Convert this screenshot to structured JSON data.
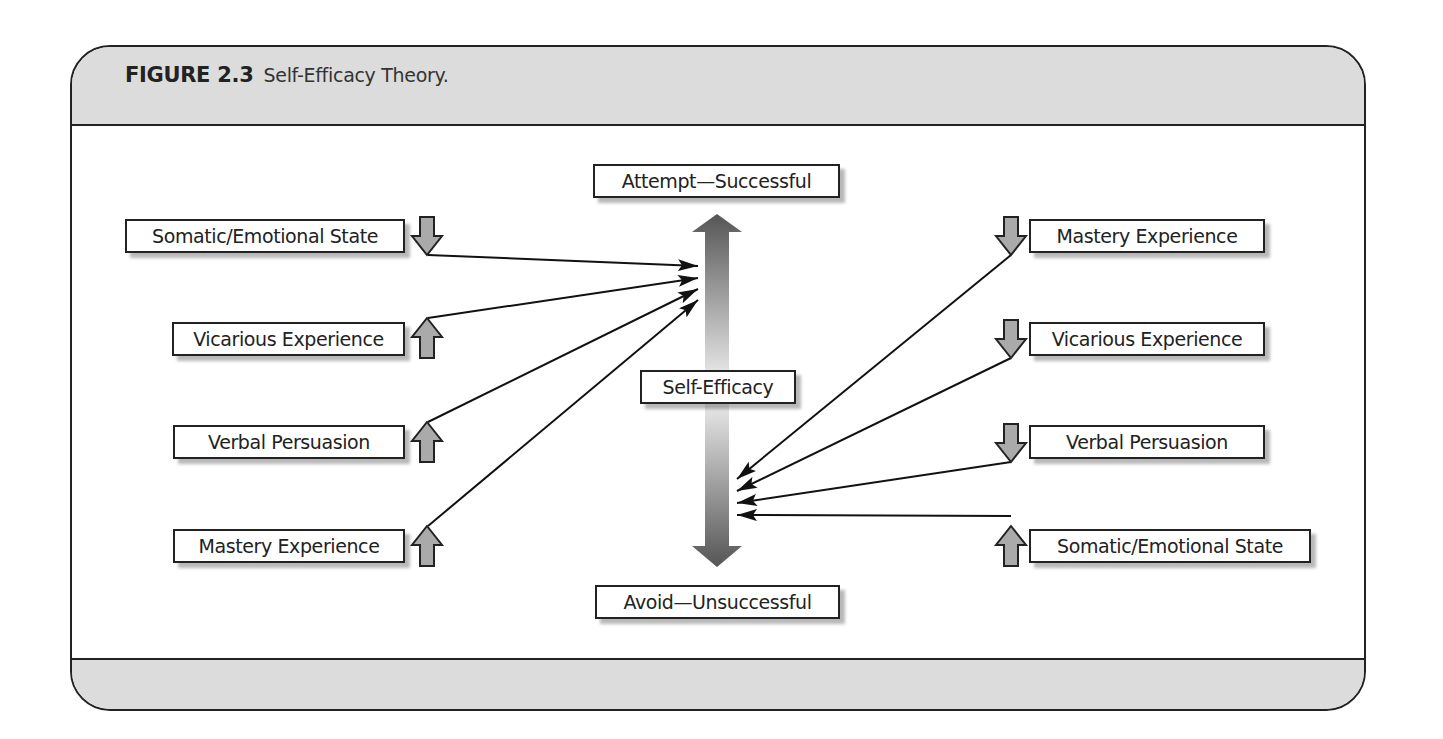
{
  "figure": {
    "number": "FIGURE 2.3",
    "title": "Self-Efficacy Theory."
  },
  "center": {
    "top_outcome": "Attempt—Successful",
    "middle_label": "Self-Efficacy",
    "bottom_outcome": "Avoid—Unsuccessful",
    "shaft_gradient": [
      "#555555",
      "#f4f4f4",
      "#555555"
    ]
  },
  "left_sources": [
    {
      "label": "Somatic/Emotional State",
      "direction": "down"
    },
    {
      "label": "Vicarious Experience",
      "direction": "up"
    },
    {
      "label": "Verbal Persuasion",
      "direction": "up"
    },
    {
      "label": "Mastery Experience",
      "direction": "up"
    }
  ],
  "right_sources": [
    {
      "label": "Mastery Experience",
      "direction": "down"
    },
    {
      "label": "Vicarious Experience",
      "direction": "down"
    },
    {
      "label": "Verbal Persuasion",
      "direction": "down"
    },
    {
      "label": "Somatic/Emotional State",
      "direction": "up"
    }
  ],
  "colors": {
    "band_fill": "#dcdcdc",
    "stroke": "#222222",
    "small_arrow_fill": "#aaaaaa"
  }
}
